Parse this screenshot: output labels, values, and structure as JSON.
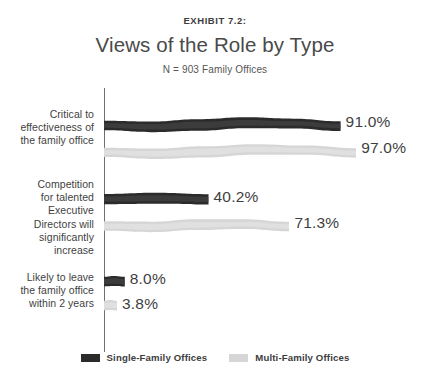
{
  "header": {
    "exhibit": "EXHIBIT 7.2:",
    "title": "Views of the Role by Type",
    "subtitle": "N = 903 Family Offices"
  },
  "legend": {
    "items": [
      {
        "label": "Single-Family Offices",
        "color": "#2b2b2b",
        "key": "single-family"
      },
      {
        "label": "Multi-Family Offices",
        "color": "#d6d6d6",
        "key": "multi-family"
      }
    ]
  },
  "categories": [
    {
      "lines": [
        "Critical to",
        "effectiveness of",
        "the family office"
      ],
      "text": "Critical to effectiveness of the family office"
    },
    {
      "lines": [
        "Competition",
        "for talented",
        "Executive",
        "Directors will",
        "significantly",
        "increase"
      ],
      "text": "Competition for talented Executive Directors will significantly increase"
    },
    {
      "lines": [
        "Likely to leave",
        "the family office",
        "within 2 years"
      ],
      "text": "Likely to leave the family office within 2 years"
    }
  ],
  "value_labels": {
    "single": [
      "91.0%",
      "40.2%",
      "8.0%"
    ],
    "multi": [
      "97.0%",
      "71.3%",
      "3.8%"
    ]
  },
  "chart_data": {
    "type": "bar",
    "orientation": "horizontal",
    "title": "Views of the Role by Type",
    "subtitle": "N = 903 Family Offices",
    "exhibit": "EXHIBIT 7.2:",
    "xlabel": "",
    "ylabel": "",
    "xlim": [
      0,
      100
    ],
    "grid": false,
    "legend_position": "bottom",
    "units": "percent",
    "categories": [
      "Critical to effectiveness of the family office",
      "Competition for talented Executive Directors will significantly increase",
      "Likely to leave the family office within 2 years"
    ],
    "series": [
      {
        "name": "Single-Family Offices",
        "color": "#2b2b2b",
        "values": [
          91.0,
          40.2,
          8.0
        ],
        "labels": [
          "91.0%",
          "40.2%",
          "8.0%"
        ]
      },
      {
        "name": "Multi-Family Offices",
        "color": "#d6d6d6",
        "values": [
          97.0,
          71.3,
          3.8
        ],
        "labels": [
          "97.0%",
          "71.3%",
          "3.8%"
        ]
      }
    ]
  }
}
